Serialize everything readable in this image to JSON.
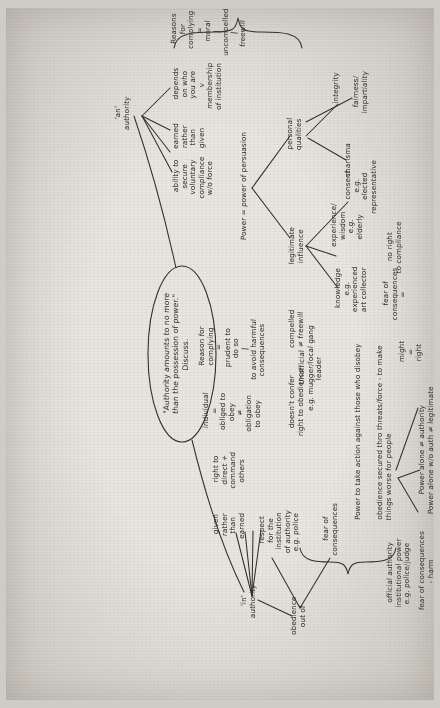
{
  "document": {
    "kind": "handwritten-mind-map",
    "orientation": "rotated-90-ccw",
    "paper_color": "#e9e6df",
    "ink_color": "#2b2b2b"
  },
  "central_topic": {
    "text": "\"Authority amounts to no more\nthan the possession of power.\"\nDiscuss."
  },
  "branches": {
    "authority": {
      "label": "'in'\nauthority",
      "children": [
        {
          "id": "given-rather-than-earned",
          "text": "given\nrather\nthan\nearned"
        },
        {
          "id": "right-to-direct",
          "text": "right to\ndirect +\ncommand\nothers"
        },
        {
          "id": "individual-obliged",
          "text": "individual\n=\nobliged to\nobey\n≠\nobligation\nto obey"
        },
        {
          "id": "reason-for-complying",
          "text": "Reason for\ncomplying\n=\nprudent to\ndo so\n|\nto avoid harmful\nconsequences"
        },
        {
          "id": "doesnt-confer",
          "text": "doesn't confer\nright to obedience"
        },
        {
          "id": "compelled-freewill",
          "text": "compelled\n≠ freewill"
        }
      ]
    },
    "obedience": {
      "label": "obedience\nout of",
      "children": [
        {
          "id": "respect-institution",
          "text": "respect\nfor the\ninstitution\nof authority\ne.g. police"
        },
        {
          "id": "fear-of-consequences",
          "text": "fear of\nconsequences"
        }
      ]
    },
    "an_authority": {
      "label": "'an'\nauthority",
      "children": [
        {
          "id": "ability-secure",
          "text": "ability to\nsecure\nvoluntary\ncompliance\nw/o force"
        },
        {
          "id": "earned-rather-given",
          "text": "earned\nrather\nthan\ngiven"
        },
        {
          "id": "depends-who",
          "text": "depends\non who\nyou are\nv\nmembership\nof institution"
        },
        {
          "id": "reasons-complying",
          "text": "Reasons\nfor\ncomplying\n=\nmoral\n|\nuncompelled\n|\nfreewill"
        }
      ]
    },
    "power_persuasion": {
      "label": "Power = power of persuasion",
      "children": [
        {
          "id": "legitimate-influence",
          "text": "legitimate\ninfluence",
          "children": [
            {
              "id": "knowledge",
              "text": "knowledge\ne.g.\nexperienced\nart collector"
            },
            {
              "id": "experience-wisdom",
              "text": "experience/\nwisdom\ne.g.\nelderly"
            },
            {
              "id": "consent",
              "text": "consent\ne.g.\nelected\nrepresentative"
            }
          ]
        },
        {
          "id": "personal-qualities",
          "text": "personal\nqualities",
          "children": [
            {
              "id": "integrity",
              "text": "integrity"
            },
            {
              "id": "charisma",
              "text": "charisma"
            },
            {
              "id": "fairness",
              "text": "fairness/\nimpartiality"
            }
          ]
        }
      ]
    },
    "power_alone": {
      "label": "Power alone ≠ authority\nPower alone w/o auth ≠ legitimate",
      "children": [
        {
          "id": "official-authority",
          "text": "official authority\ninstitutional power\ne.g. police/judge"
        },
        {
          "id": "fear-consequences-harm",
          "text": "fear of consequences\n- harm"
        },
        {
          "id": "unofficial",
          "text": "Unofficial\ne.g. mugger/local gang\nleader"
        },
        {
          "id": "might-right",
          "text": "might\n=\nright"
        },
        {
          "id": "fear-of-consequences-2",
          "text": "fear of\nconsequences\n="
        },
        {
          "id": "no-right-compliance",
          "text": "no right\nto compliance"
        },
        {
          "id": "power-take-action",
          "text": "Power to take action against those who disobey"
        },
        {
          "id": "obedience-secured",
          "text": "obedience secured thro threats/force - to make\nthings worse for people"
        }
      ]
    }
  }
}
